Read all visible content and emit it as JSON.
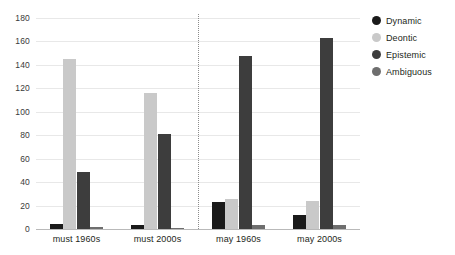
{
  "chart_data": {
    "type": "bar",
    "title": "",
    "subtitle": "",
    "xlabel": "",
    "ylabel": "",
    "categories": [
      "must 1960s",
      "must 2000s",
      "may 1960s",
      "may 2000s"
    ],
    "series": [
      {
        "name": "Dynamic",
        "color": "#1a1a1a",
        "values": [
          4,
          3,
          23,
          12
        ]
      },
      {
        "name": "Deontic",
        "color": "#c9c9c9",
        "values": [
          145,
          116,
          26,
          24
        ]
      },
      {
        "name": "Epistemic",
        "color": "#3d3d3d",
        "values": [
          49,
          81,
          148,
          163
        ]
      },
      {
        "name": "Ambiguous",
        "color": "#6e6e6e",
        "values": [
          2,
          1,
          3,
          3
        ]
      }
    ],
    "ylim": [
      0,
      180
    ],
    "yticks": [
      0,
      20,
      40,
      60,
      80,
      100,
      120,
      140,
      160,
      180
    ],
    "ytick_labels": [
      "0",
      "20",
      "40",
      "60",
      "80",
      "100",
      "120",
      "140",
      "160",
      "180"
    ],
    "grid": true,
    "grid_color": "#e8e8e8",
    "legend_position": "right",
    "annotations": [
      {
        "type": "vertical-divider",
        "after_category": "must 2000s",
        "style": "dotted",
        "color": "#8c8c8c"
      }
    ],
    "background_color": "#ffffff",
    "axis_color": "#b9b9b9"
  }
}
